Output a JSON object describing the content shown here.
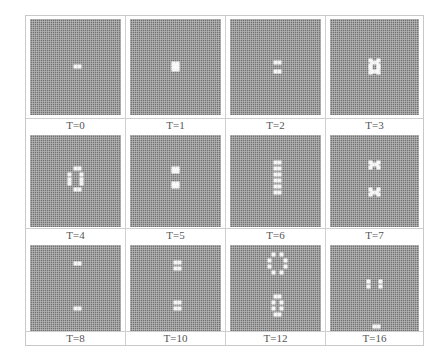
{
  "figure": {
    "grid_colors": {
      "background": "#707070",
      "gridline": "#c8c8c8",
      "live_cell": "#f4f4f4"
    },
    "panels": [
      {
        "label": "T=0",
        "pattern": [
          [
            0,
            0
          ],
          [
            2,
            0
          ]
        ]
      },
      {
        "label": "T=1",
        "pattern": [
          [
            -1,
            -2
          ],
          [
            1,
            -2
          ],
          [
            0,
            -1
          ],
          [
            -1,
            0
          ],
          [
            1,
            0
          ],
          [
            0,
            1
          ],
          [
            -1,
            2
          ],
          [
            1,
            2
          ]
        ]
      },
      {
        "label": "T=2",
        "pattern": [
          [
            0,
            -3
          ],
          [
            2,
            -3
          ],
          [
            0,
            3
          ],
          [
            2,
            3
          ]
        ]
      },
      {
        "label": "T=3",
        "pattern": [
          [
            -2,
            -4
          ],
          [
            2,
            -4
          ],
          [
            -1,
            -3
          ],
          [
            1,
            -3
          ],
          [
            -2,
            -1
          ],
          [
            2,
            -1
          ],
          [
            -2,
            1
          ],
          [
            2,
            1
          ],
          [
            -1,
            3
          ],
          [
            1,
            3
          ],
          [
            -2,
            4
          ],
          [
            2,
            4
          ]
        ]
      },
      {
        "label": "T=4",
        "pattern": [
          [
            0,
            -8
          ],
          [
            2,
            -8
          ],
          [
            -3,
            -4
          ],
          [
            3,
            -4
          ],
          [
            -3,
            -1
          ],
          [
            3,
            -1
          ],
          [
            -3,
            2
          ],
          [
            3,
            2
          ],
          [
            0,
            6
          ],
          [
            2,
            6
          ]
        ]
      },
      {
        "label": "T=5",
        "pattern": [
          [
            -1,
            -8
          ],
          [
            1,
            -8
          ],
          [
            0,
            -7
          ],
          [
            -1,
            -6
          ],
          [
            1,
            -6
          ],
          [
            -1,
            2
          ],
          [
            1,
            2
          ],
          [
            0,
            3
          ],
          [
            -1,
            4
          ],
          [
            1,
            4
          ]
        ]
      },
      {
        "label": "T=6",
        "pattern": [
          [
            0,
            -12
          ],
          [
            2,
            -12
          ],
          [
            0,
            -8
          ],
          [
            2,
            -8
          ],
          [
            0,
            -4
          ],
          [
            2,
            -4
          ],
          [
            0,
            0
          ],
          [
            2,
            0
          ],
          [
            0,
            4
          ],
          [
            2,
            4
          ],
          [
            0,
            8
          ],
          [
            2,
            8
          ]
        ]
      },
      {
        "label": "T=7",
        "pattern": [
          [
            -2,
            -12
          ],
          [
            2,
            -12
          ],
          [
            -1,
            -11
          ],
          [
            1,
            -11
          ],
          [
            -2,
            -9
          ],
          [
            2,
            -9
          ],
          [
            -2,
            6
          ],
          [
            2,
            6
          ],
          [
            -1,
            8
          ],
          [
            1,
            8
          ],
          [
            -2,
            9
          ],
          [
            2,
            9
          ]
        ]
      },
      {
        "label": "T=8",
        "pattern": [
          [
            0,
            -16
          ],
          [
            2,
            -16
          ],
          [
            0,
            14
          ],
          [
            2,
            14
          ]
        ]
      },
      {
        "label": "T=10",
        "pattern": [
          [
            0,
            -17
          ],
          [
            2,
            -17
          ],
          [
            0,
            -13
          ],
          [
            2,
            -13
          ],
          [
            0,
            10
          ],
          [
            2,
            10
          ],
          [
            0,
            14
          ],
          [
            2,
            14
          ]
        ]
      },
      {
        "label": "T=12",
        "pattern": [
          [
            -1,
            -22
          ],
          [
            3,
            -22
          ],
          [
            -3,
            -18
          ],
          [
            5,
            -18
          ],
          [
            -3,
            -14
          ],
          [
            5,
            -14
          ],
          [
            -1,
            -10
          ],
          [
            3,
            -10
          ],
          [
            0,
            6
          ],
          [
            2,
            6
          ],
          [
            -1,
            10
          ],
          [
            3,
            10
          ],
          [
            -1,
            14
          ],
          [
            3,
            14
          ],
          [
            0,
            18
          ],
          [
            2,
            18
          ]
        ]
      },
      {
        "label": "T=16",
        "pattern": [
          [
            0,
            -30
          ],
          [
            2,
            -30
          ],
          [
            -3,
            -4
          ],
          [
            3,
            -4
          ],
          [
            -3,
            -1
          ],
          [
            3,
            -1
          ],
          [
            0,
            26
          ],
          [
            2,
            26
          ]
        ]
      }
    ]
  }
}
